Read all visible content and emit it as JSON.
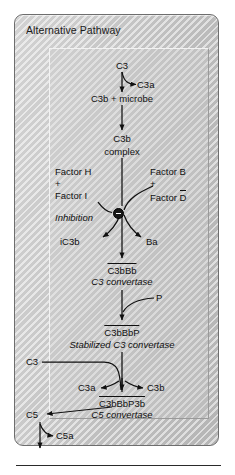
{
  "card": {
    "title": "Alternative Pathway"
  },
  "diagram": {
    "type": "flowchart",
    "title": "Alternative Pathway",
    "nodes": [
      {
        "id": "c3_top",
        "label": "C3",
        "style": "plain"
      },
      {
        "id": "c3a_top",
        "label": "C3a",
        "style": "plain"
      },
      {
        "id": "c3b_microbe",
        "label": "C3b + microbe",
        "style": "plain"
      },
      {
        "id": "c3b_complex_1",
        "label": "C3b",
        "style": "plain"
      },
      {
        "id": "c3b_complex_2",
        "label": "complex",
        "style": "plain"
      },
      {
        "id": "factor_h",
        "label": "Factor H",
        "style": "plain"
      },
      {
        "id": "plus_left",
        "label": "+",
        "style": "plain"
      },
      {
        "id": "factor_i",
        "label": "Factor I",
        "style": "plain"
      },
      {
        "id": "factor_b",
        "label": "Factor B",
        "style": "plain"
      },
      {
        "id": "plus_right",
        "label": "+",
        "style": "plain"
      },
      {
        "id": "factor_d",
        "label": "Factor D",
        "style": "overbar-last"
      },
      {
        "id": "inhibition",
        "label": "Inhibition",
        "style": "italic"
      },
      {
        "id": "ic3b",
        "label": "iC3b",
        "style": "plain"
      },
      {
        "id": "ba",
        "label": "Ba",
        "style": "plain"
      },
      {
        "id": "c3bbb",
        "label": "C3bBb",
        "style": "overbar"
      },
      {
        "id": "c3_convertase",
        "label": "C3 convertase",
        "style": "italic"
      },
      {
        "id": "p",
        "label": "P",
        "style": "plain"
      },
      {
        "id": "c3bbbp",
        "label": "C3bBbP",
        "style": "overbar"
      },
      {
        "id": "stab_conv",
        "label": "Stabilized C3 convertase",
        "style": "italic"
      },
      {
        "id": "c3_left",
        "label": "C3",
        "style": "plain"
      },
      {
        "id": "c3a_bot",
        "label": "C3a",
        "style": "plain"
      },
      {
        "id": "c3b_bot",
        "label": "C3b",
        "style": "plain"
      },
      {
        "id": "c3bbbp3b",
        "label": "C3bBbP3b",
        "style": "overbar"
      },
      {
        "id": "c5_convertase",
        "label": "C5 convertase",
        "style": "italic"
      },
      {
        "id": "c5",
        "label": "C5",
        "style": "plain"
      },
      {
        "id": "c5a",
        "label": "C5a",
        "style": "plain"
      }
    ],
    "symbols": [
      {
        "id": "inhibition-badge",
        "kind": "minus-circle"
      }
    ]
  },
  "labels": {
    "c3_top": "C3",
    "c3a_top": "C3a",
    "c3b_microbe": "C3b + microbe",
    "c3b_complex_1": "C3b",
    "c3b_complex_2": "complex",
    "factor_h": "Factor H",
    "plus_left": "+",
    "factor_i": "Factor I",
    "factor_b": "Factor B",
    "plus_right": "+",
    "factor_d_stem": "Factor ",
    "factor_d_bar": "D",
    "inhibition": "Inhibition",
    "ic3b": "iC3b",
    "ba": "Ba",
    "c3bbb": "C3bBb",
    "c3_convertase": "C3 convertase",
    "p": "P",
    "c3bbbp": "C3bBbP",
    "stab_conv": "Stabilized C3 convertase",
    "c3_left": "C3",
    "c3a_bot": "C3a",
    "c3b_bot": "C3b",
    "c3bbbp3b": "C3bBbP3b",
    "c5_convertase": "C5 convertase",
    "c5": "C5",
    "c5a": "C5a"
  },
  "colors": {
    "ink": "#101010",
    "card_border": "#6e6e6e",
    "panel_light": "#cfcfcf",
    "rule": "#2a2a2a"
  }
}
